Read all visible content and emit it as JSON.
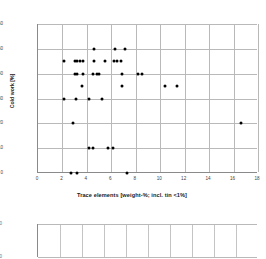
{
  "chart_data": {
    "type": "scatter",
    "title": "",
    "xlabel": "Trace elements [weight-%; incl. tin <1%]",
    "ylabel": "Cold work [%]",
    "xlim": [
      0,
      18
    ],
    "ylim": [
      0,
      60
    ],
    "xticks": [
      0,
      2,
      4,
      6,
      8,
      10,
      12,
      14,
      16,
      18
    ],
    "yticks": [
      0,
      10,
      20,
      30,
      40,
      50,
      60
    ],
    "grid": true,
    "legend": "none",
    "marker": "filled-circle",
    "marker_color": "#000000",
    "points": [
      {
        "x": 4.6,
        "y": 50
      },
      {
        "x": 6.3,
        "y": 50
      },
      {
        "x": 7.1,
        "y": 50
      },
      {
        "x": 2.1,
        "y": 45
      },
      {
        "x": 3.0,
        "y": 45
      },
      {
        "x": 3.2,
        "y": 45
      },
      {
        "x": 3.4,
        "y": 45
      },
      {
        "x": 3.7,
        "y": 45
      },
      {
        "x": 4.6,
        "y": 45
      },
      {
        "x": 5.5,
        "y": 45
      },
      {
        "x": 6.2,
        "y": 45
      },
      {
        "x": 6.5,
        "y": 45
      },
      {
        "x": 6.8,
        "y": 45
      },
      {
        "x": 3.0,
        "y": 40
      },
      {
        "x": 3.2,
        "y": 40
      },
      {
        "x": 3.7,
        "y": 40
      },
      {
        "x": 4.5,
        "y": 40
      },
      {
        "x": 4.8,
        "y": 40
      },
      {
        "x": 5.0,
        "y": 40
      },
      {
        "x": 6.9,
        "y": 40
      },
      {
        "x": 8.2,
        "y": 40
      },
      {
        "x": 8.5,
        "y": 40
      },
      {
        "x": 3.6,
        "y": 35
      },
      {
        "x": 6.9,
        "y": 35
      },
      {
        "x": 10.4,
        "y": 35
      },
      {
        "x": 11.4,
        "y": 35
      },
      {
        "x": 2.1,
        "y": 30
      },
      {
        "x": 3.1,
        "y": 30
      },
      {
        "x": 4.2,
        "y": 30
      },
      {
        "x": 5.2,
        "y": 30
      },
      {
        "x": 2.9,
        "y": 20
      },
      {
        "x": 16.6,
        "y": 20
      },
      {
        "x": 4.2,
        "y": 10
      },
      {
        "x": 4.5,
        "y": 10
      },
      {
        "x": 5.7,
        "y": 10
      },
      {
        "x": 6.1,
        "y": 10
      },
      {
        "x": 2.7,
        "y": 0
      },
      {
        "x": 3.2,
        "y": 0
      },
      {
        "x": 7.3,
        "y": 0
      }
    ]
  },
  "secondary_chart": {
    "type": "scatter",
    "visible_yticks": [
      "60",
      "50"
    ],
    "xgrid_count": 9,
    "points": []
  }
}
